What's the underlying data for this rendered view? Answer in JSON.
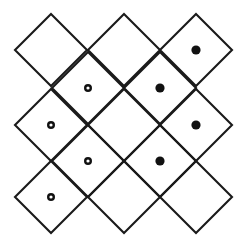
{
  "figure": {
    "name": "diamond-lattice-marker-diagram",
    "type": "geometric-diagram",
    "background_color": "#ffffff",
    "line_color": "#1a1a1a",
    "line_width": 2.1,
    "canvas": {
      "width": 242,
      "height": 252
    }
  },
  "lattice": {
    "description": "Grid of squares rotated 45 degrees (diamonds) tiled in a staggered diagonal arrangement",
    "half_diagonal": 36,
    "cell_step": 36,
    "origin": {
      "x": 51,
      "y": 14
    },
    "diamond_count": 13,
    "diamonds": [
      {
        "id": "d-r1-c1",
        "cx": 51,
        "cy": 50,
        "row": 1,
        "col": 1
      },
      {
        "id": "d-r1-c2",
        "cx": 124,
        "cy": 50,
        "row": 1,
        "col": 2
      },
      {
        "id": "d-r1-c3",
        "cx": 196,
        "cy": 50,
        "row": 1,
        "col": 3
      },
      {
        "id": "d-r2-c1",
        "cx": 88,
        "cy": 88,
        "row": 2,
        "col": 1
      },
      {
        "id": "d-r2-c2",
        "cx": 160,
        "cy": 88,
        "row": 2,
        "col": 2
      },
      {
        "id": "d-r3-c1",
        "cx": 51,
        "cy": 125,
        "row": 3,
        "col": 1
      },
      {
        "id": "d-r3-c2",
        "cx": 124,
        "cy": 125,
        "row": 3,
        "col": 2
      },
      {
        "id": "d-r3-c3",
        "cx": 196,
        "cy": 125,
        "row": 3,
        "col": 3
      },
      {
        "id": "d-r4-c1",
        "cx": 88,
        "cy": 161,
        "row": 4,
        "col": 1
      },
      {
        "id": "d-r4-c2",
        "cx": 160,
        "cy": 161,
        "row": 4,
        "col": 2
      },
      {
        "id": "d-r5-c1",
        "cx": 51,
        "cy": 197,
        "row": 5,
        "col": 1
      },
      {
        "id": "d-r5-c2",
        "cx": 124,
        "cy": 197,
        "row": 5,
        "col": 2
      },
      {
        "id": "d-r5-c3",
        "cx": 196,
        "cy": 197,
        "row": 5,
        "col": 3
      }
    ]
  },
  "markers": {
    "filled_count": 4,
    "hollow_count": 4,
    "filled_radius": 4.6,
    "hollow_outer_radius": 4.0,
    "hollow_inner_radius": 1.6,
    "filled_color": "#111111",
    "hollow_color": "#111111",
    "items": [
      {
        "id": "m-filled-top-right",
        "style": "filled",
        "cx": 196,
        "cy": 50,
        "in_diamond": "d-r1-c3"
      },
      {
        "id": "m-hollow-upper-left",
        "style": "hollow",
        "cx": 88,
        "cy": 88,
        "in_diamond": "d-r2-c1"
      },
      {
        "id": "m-filled-upper-right",
        "style": "filled",
        "cx": 160,
        "cy": 88,
        "in_diamond": "d-r2-c2"
      },
      {
        "id": "m-hollow-mid-left",
        "style": "hollow",
        "cx": 51,
        "cy": 125,
        "in_diamond": "d-r3-c1"
      },
      {
        "id": "m-filled-mid-right",
        "style": "filled",
        "cx": 196,
        "cy": 125,
        "in_diamond": "d-r3-c3"
      },
      {
        "id": "m-hollow-lower-left",
        "style": "hollow",
        "cx": 88,
        "cy": 161,
        "in_diamond": "d-r4-c1"
      },
      {
        "id": "m-filled-lower-right",
        "style": "filled",
        "cx": 160,
        "cy": 161,
        "in_diamond": "d-r4-c2"
      },
      {
        "id": "m-hollow-bottom-left",
        "style": "hollow",
        "cx": 51,
        "cy": 197,
        "in_diamond": "d-r5-c1"
      }
    ]
  }
}
